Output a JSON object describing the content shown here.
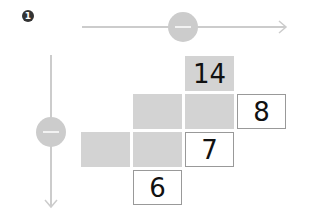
{
  "badge": {
    "label": "1"
  },
  "axes": {
    "horizontal": {
      "line_color": "#cccccc",
      "handle_color": "#cccccc",
      "direction": "right"
    },
    "vertical": {
      "line_color": "#cccccc",
      "handle_color": "#cccccc",
      "direction": "down"
    }
  },
  "grid": {
    "cells": [
      {
        "col": 2,
        "row": 0,
        "style": "shaded",
        "value": "14"
      },
      {
        "col": 1,
        "row": 1,
        "style": "shaded",
        "value": ""
      },
      {
        "col": 2,
        "row": 1,
        "style": "shaded",
        "value": ""
      },
      {
        "col": 3,
        "row": 1,
        "style": "boxed",
        "value": "8"
      },
      {
        "col": 0,
        "row": 2,
        "style": "shaded",
        "value": ""
      },
      {
        "col": 1,
        "row": 2,
        "style": "shaded",
        "value": ""
      },
      {
        "col": 2,
        "row": 2,
        "style": "boxed",
        "value": "7"
      },
      {
        "col": 1,
        "row": 3,
        "style": "boxed",
        "value": "6"
      }
    ]
  }
}
